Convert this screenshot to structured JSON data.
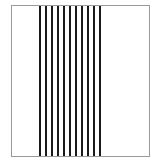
{
  "figure": {
    "caption": "",
    "background_color": "#ffffff",
    "frame": {
      "name": "bounding-box",
      "border_color": "#9a9a9a",
      "border_width": 1,
      "fill_color": "#ffffff",
      "x": 11,
      "y": 5,
      "width": 139,
      "height": 152
    }
  },
  "chart_data": {
    "type": "bar",
    "xlabel": "",
    "ylabel": "",
    "categories": [
      "1",
      "2",
      "3",
      "4",
      "5",
      "6",
      "7",
      "8",
      "9",
      "10",
      "11"
    ],
    "values": [
      1,
      1,
      1,
      1,
      1,
      1,
      1,
      1,
      1,
      1,
      1
    ],
    "grid": false,
    "legend_position": "none",
    "line_color": "#1a1a1a",
    "line_count": 11,
    "line_width_px": 2,
    "gap_width_px": 4,
    "band_start_px": 27,
    "band_end_px": 95,
    "orientation": "vertical",
    "spans_full_height": true
  }
}
